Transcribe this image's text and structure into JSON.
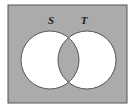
{
  "diagram": {
    "type": "venn",
    "shaded_region": "complement of symmetric difference (intersection of S and T plus region outside both)",
    "colors": {
      "shade": "#ababab",
      "unshaded": "#ffffff",
      "outline": "#555555",
      "background": "#ffffff"
    },
    "universe": {
      "x": 8,
      "y": 5,
      "width": 119,
      "height": 98
    },
    "sets": [
      {
        "label": "S",
        "cx": 50,
        "cy": 60,
        "r": 29,
        "label_x": 51,
        "label_y": 24
      },
      {
        "label": "T",
        "cx": 87,
        "cy": 60,
        "r": 29,
        "label_x": 84,
        "label_y": 24
      }
    ]
  }
}
